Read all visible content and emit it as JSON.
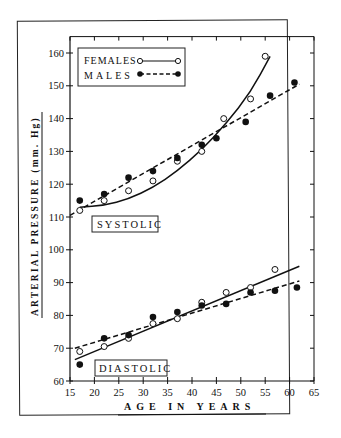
{
  "chart_data": {
    "type": "scatter",
    "title": "",
    "xlabel": "AGE IN YEARS",
    "ylabel": "ARTERIAL PRESSURE (mm. Hg)",
    "xlim": [
      15,
      65
    ],
    "ylim": [
      60,
      165
    ],
    "xticks": [
      15,
      20,
      25,
      30,
      35,
      40,
      45,
      50,
      55,
      60,
      65
    ],
    "yticks": [
      60,
      70,
      80,
      90,
      100,
      110,
      120,
      130,
      140,
      150,
      160
    ],
    "grid": false,
    "legend": {
      "placement": "top-left",
      "entries": [
        {
          "label": "FEMALES",
          "marker": "open-circle",
          "line": "solid"
        },
        {
          "label": "MALES",
          "marker": "filled-circle",
          "line": "dashed"
        }
      ]
    },
    "annotations": [
      "SYSTOLIC",
      "DIASTOLIC"
    ],
    "series": [
      {
        "name": "Systolic Females",
        "group": "SYSTOLIC",
        "sex": "FEMALES",
        "marker": "open-circle",
        "points": [
          [
            17,
            112
          ],
          [
            22,
            115
          ],
          [
            27,
            118
          ],
          [
            32,
            121
          ],
          [
            37,
            127
          ],
          [
            42,
            130
          ],
          [
            46.5,
            140
          ],
          [
            52,
            146
          ],
          [
            55,
            159
          ]
        ],
        "fit": {
          "kind": "curve",
          "points": [
            [
              17,
              113
            ],
            [
              22,
              113.5
            ],
            [
              27,
              115.5
            ],
            [
              32,
              119
            ],
            [
              37,
              124
            ],
            [
              42,
              130.5
            ],
            [
              47,
              138.5
            ],
            [
              52,
              148
            ],
            [
              56,
              159
            ]
          ]
        }
      },
      {
        "name": "Systolic Males",
        "group": "SYSTOLIC",
        "sex": "MALES",
        "marker": "filled-circle",
        "points": [
          [
            17,
            115
          ],
          [
            22,
            117
          ],
          [
            27,
            122
          ],
          [
            32,
            124
          ],
          [
            37,
            128
          ],
          [
            42,
            132
          ],
          [
            45,
            134
          ],
          [
            51,
            139
          ],
          [
            56,
            147
          ],
          [
            61,
            151
          ]
        ],
        "fit": {
          "kind": "line",
          "points": [
            [
              15,
              110.5
            ],
            [
              62,
              150.5
            ]
          ]
        }
      },
      {
        "name": "Diastolic Females",
        "group": "DIASTOLIC",
        "sex": "FEMALES",
        "marker": "open-circle",
        "points": [
          [
            17,
            69
          ],
          [
            22,
            70.5
          ],
          [
            27,
            73
          ],
          [
            32,
            77.5
          ],
          [
            37,
            79
          ],
          [
            42,
            84
          ],
          [
            47,
            87
          ],
          [
            52,
            88.5
          ],
          [
            57,
            94
          ]
        ],
        "fit": {
          "kind": "line",
          "points": [
            [
              16,
              66.5
            ],
            [
              62,
              95
            ]
          ]
        }
      },
      {
        "name": "Diastolic Males",
        "group": "DIASTOLIC",
        "sex": "MALES",
        "marker": "filled-circle",
        "points": [
          [
            17,
            65
          ],
          [
            22,
            73
          ],
          [
            27,
            74
          ],
          [
            32,
            79.5
          ],
          [
            37,
            81
          ],
          [
            42,
            83
          ],
          [
            47,
            83.5
          ],
          [
            52,
            87
          ],
          [
            57,
            87.5
          ],
          [
            61.5,
            88.5
          ]
        ],
        "fit": {
          "kind": "line",
          "points": [
            [
              16,
              70
            ],
            [
              62,
              90.5
            ]
          ]
        }
      }
    ]
  }
}
